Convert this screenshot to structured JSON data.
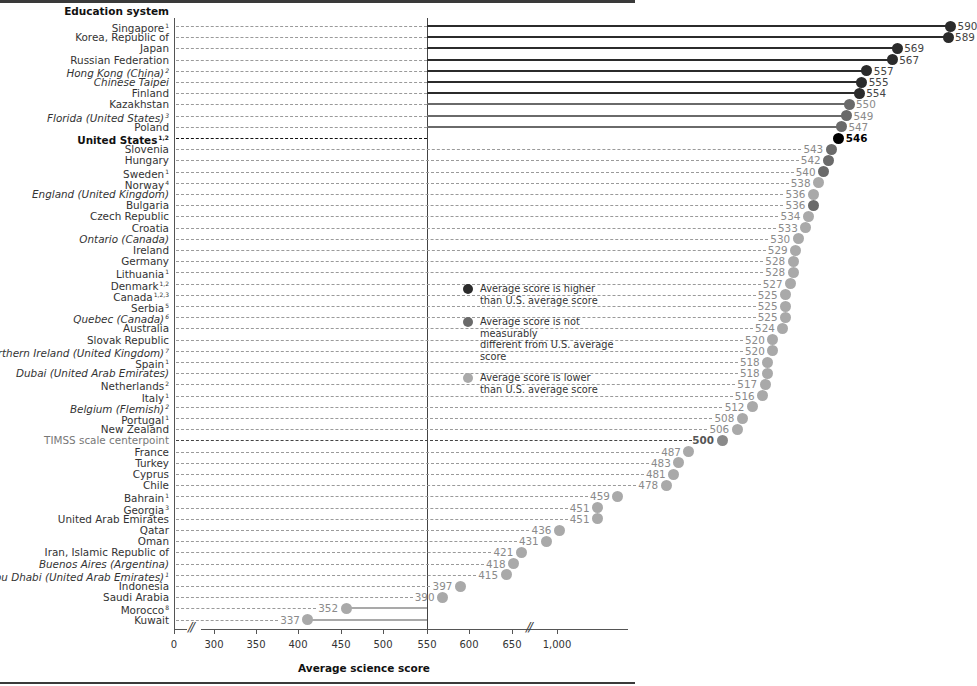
{
  "chart_data": {
    "type": "lollipop",
    "title": "",
    "xlabel": "Average science score",
    "ylabel": "Education system",
    "reference_line": {
      "label": "U.S. average",
      "value": 546
    },
    "xlim": [
      0,
      1000
    ],
    "x_ticks": [
      "0",
      "300",
      "350",
      "400",
      "450",
      "500",
      "550",
      "600",
      "650",
      "1,000"
    ],
    "axis_breaks": [
      "between 0 and 300",
      "between 650 and 1,000"
    ],
    "legend": [
      {
        "key": "higher",
        "label_line1": "Average score is higher",
        "label_line2": "than U.S. average score",
        "color": "#2b2b2b"
      },
      {
        "key": "same",
        "label_line1": "Average score is not measurably",
        "label_line2": "different from U.S. average score",
        "color": "#6a6a6a"
      },
      {
        "key": "lower",
        "label_line1": "Average score is lower",
        "label_line2": "than U.S. average score",
        "color": "#a9a9a9"
      }
    ],
    "colors": {
      "higher": "#2b2b2b",
      "same": "#6a6a6a",
      "lower": "#a9a9a9",
      "us": "#000000",
      "centerpoint": "#8a8a8a"
    },
    "rows": [
      {
        "name": "Singapore",
        "sup": "1",
        "score": 590,
        "status": "higher",
        "style": ""
      },
      {
        "name": "Korea, Republic of",
        "sup": "",
        "score": 589,
        "status": "higher",
        "style": ""
      },
      {
        "name": "Japan",
        "sup": "",
        "score": 569,
        "status": "higher",
        "style": ""
      },
      {
        "name": "Russian Federation",
        "sup": "",
        "score": 567,
        "status": "higher",
        "style": ""
      },
      {
        "name": "Hong Kong (China)",
        "sup": "2",
        "score": 557,
        "status": "higher",
        "style": "italic"
      },
      {
        "name": "Chinese Taipei",
        "sup": "",
        "score": 555,
        "status": "higher",
        "style": "italic"
      },
      {
        "name": "Finland",
        "sup": "",
        "score": 554,
        "status": "higher",
        "style": ""
      },
      {
        "name": "Kazakhstan",
        "sup": "",
        "score": 550,
        "status": "same",
        "style": ""
      },
      {
        "name": "Florida (United States)",
        "sup": "3",
        "score": 549,
        "status": "same",
        "style": "italic"
      },
      {
        "name": "Poland",
        "sup": "",
        "score": 547,
        "status": "same",
        "style": ""
      },
      {
        "name": "United States",
        "sup": "1,2",
        "score": 546,
        "status": "us",
        "style": "bold"
      },
      {
        "name": "Slovenia",
        "sup": "",
        "score": 543,
        "status": "same",
        "style": ""
      },
      {
        "name": "Hungary",
        "sup": "",
        "score": 542,
        "status": "same",
        "style": ""
      },
      {
        "name": "Sweden",
        "sup": "1",
        "score": 540,
        "status": "same",
        "style": ""
      },
      {
        "name": "Norway",
        "sup": "4",
        "score": 538,
        "status": "lower",
        "style": ""
      },
      {
        "name": "England (United Kingdom)",
        "sup": "",
        "score": 536,
        "status": "lower",
        "style": "italic"
      },
      {
        "name": "Bulgaria",
        "sup": "",
        "score": 536,
        "status": "same",
        "style": ""
      },
      {
        "name": "Czech Republic",
        "sup": "",
        "score": 534,
        "status": "lower",
        "style": ""
      },
      {
        "name": "Croatia",
        "sup": "",
        "score": 533,
        "status": "lower",
        "style": ""
      },
      {
        "name": "Ontario (Canada)",
        "sup": "",
        "score": 530,
        "status": "lower",
        "style": "italic"
      },
      {
        "name": "Ireland",
        "sup": "",
        "score": 529,
        "status": "lower",
        "style": ""
      },
      {
        "name": "Germany",
        "sup": "",
        "score": 528,
        "status": "lower",
        "style": ""
      },
      {
        "name": "Lithuania",
        "sup": "1",
        "score": 528,
        "status": "lower",
        "style": ""
      },
      {
        "name": "Denmark",
        "sup": "1,2",
        "score": 527,
        "status": "lower",
        "style": ""
      },
      {
        "name": "Canada",
        "sup": "1,2,3",
        "score": 525,
        "status": "lower",
        "style": ""
      },
      {
        "name": "Serbia",
        "sup": "5",
        "score": 525,
        "status": "lower",
        "style": ""
      },
      {
        "name": "Quebec (Canada)",
        "sup": "6",
        "score": 525,
        "status": "lower",
        "style": "italic"
      },
      {
        "name": "Australia",
        "sup": "",
        "score": 524,
        "status": "lower",
        "style": ""
      },
      {
        "name": "Slovak Republic",
        "sup": "",
        "score": 520,
        "status": "lower",
        "style": ""
      },
      {
        "name": "Northern Ireland (United Kingdom)",
        "sup": "7",
        "score": 520,
        "status": "lower",
        "style": "italic"
      },
      {
        "name": "Spain",
        "sup": "1",
        "score": 518,
        "status": "lower",
        "style": ""
      },
      {
        "name": "Dubai (United Arab Emirates)",
        "sup": "",
        "score": 518,
        "status": "lower",
        "style": "italic"
      },
      {
        "name": "Netherlands",
        "sup": "2",
        "score": 517,
        "status": "lower",
        "style": ""
      },
      {
        "name": "Italy",
        "sup": "1",
        "score": 516,
        "status": "lower",
        "style": ""
      },
      {
        "name": "Belgium (Flemish)",
        "sup": "2",
        "score": 512,
        "status": "lower",
        "style": "italic"
      },
      {
        "name": "Portugal",
        "sup": "1",
        "score": 508,
        "status": "lower",
        "style": ""
      },
      {
        "name": "New Zealand",
        "sup": "",
        "score": 506,
        "status": "lower",
        "style": ""
      },
      {
        "name": "TIMSS scale centerpoint",
        "sup": "",
        "score": 500,
        "status": "centerpoint",
        "style": "centerpoint"
      },
      {
        "name": "France",
        "sup": "",
        "score": 487,
        "status": "lower",
        "style": ""
      },
      {
        "name": "Turkey",
        "sup": "",
        "score": 483,
        "status": "lower",
        "style": ""
      },
      {
        "name": "Cyprus",
        "sup": "",
        "score": 481,
        "status": "lower",
        "style": ""
      },
      {
        "name": "Chile",
        "sup": "",
        "score": 478,
        "status": "lower",
        "style": ""
      },
      {
        "name": "Bahrain",
        "sup": "1",
        "score": 459,
        "status": "lower",
        "style": ""
      },
      {
        "name": "Georgia",
        "sup": "3",
        "score": 451,
        "status": "lower",
        "style": ""
      },
      {
        "name": "United Arab Emirates",
        "sup": "",
        "score": 451,
        "status": "lower",
        "style": ""
      },
      {
        "name": "Qatar",
        "sup": "",
        "score": 436,
        "status": "lower",
        "style": ""
      },
      {
        "name": "Oman",
        "sup": "",
        "score": 431,
        "status": "lower",
        "style": ""
      },
      {
        "name": "Iran, Islamic Republic of",
        "sup": "",
        "score": 421,
        "status": "lower",
        "style": ""
      },
      {
        "name": "Buenos Aires (Argentina)",
        "sup": "",
        "score": 418,
        "status": "lower",
        "style": "italic"
      },
      {
        "name": "Abu Dhabi (United Arab Emirates)",
        "sup": "1",
        "score": 415,
        "status": "lower",
        "style": "italic"
      },
      {
        "name": "Indonesia",
        "sup": "",
        "score": 397,
        "status": "lower",
        "style": ""
      },
      {
        "name": "Saudi Arabia",
        "sup": "",
        "score": 390,
        "status": "lower",
        "style": ""
      },
      {
        "name": "Morocco",
        "sup": "8",
        "score": 352,
        "status": "lower",
        "style": ""
      },
      {
        "name": "Kuwait",
        "sup": "",
        "score": 337,
        "status": "lower",
        "style": ""
      }
    ]
  },
  "header": {
    "column_label": "Education system"
  }
}
